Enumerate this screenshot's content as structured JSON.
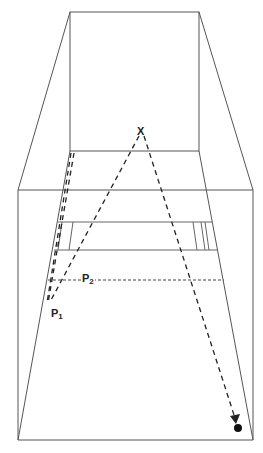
{
  "diagram": {
    "title": "",
    "labels": {
      "x": "X",
      "p1": "P",
      "p1_sub": "1",
      "p2": "P",
      "p2_sub": "2"
    },
    "colors": {
      "line": "#555555",
      "dash": "#222222",
      "background": "#ffffff"
    },
    "elements": [
      "back-wall",
      "room-perspective-lines",
      "front-frame",
      "shelf-band",
      "dashed-path-x-to-p1",
      "dashed-path-x-to-target",
      "dotted-line-p2",
      "target-dot"
    ]
  }
}
